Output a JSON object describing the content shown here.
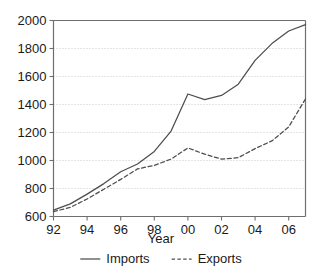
{
  "chart_data": {
    "type": "line",
    "title": "",
    "subtitle": "",
    "xlabel": "Year",
    "ylabel": "",
    "xlim": [
      1992,
      2007
    ],
    "ylim": [
      600,
      2000
    ],
    "grid": true,
    "grid_axis": "y",
    "legend_position": "bottom",
    "x": [
      1992,
      1993,
      1994,
      1995,
      1996,
      1997,
      1998,
      1999,
      2000,
      2001,
      2002,
      2003,
      2004,
      2005,
      2006,
      2007
    ],
    "x_tick_values": [
      1992,
      1994,
      1996,
      1998,
      2000,
      2002,
      2004,
      2006
    ],
    "x_tick_labels": [
      "92",
      "94",
      "96",
      "98",
      "00",
      "02",
      "04",
      "06"
    ],
    "y_tick_values": [
      600,
      800,
      1000,
      1200,
      1400,
      1600,
      1800,
      2000
    ],
    "y_tick_labels": [
      "600",
      "800",
      "1000",
      "1200",
      "1400",
      "1600",
      "1800",
      "2000"
    ],
    "series": [
      {
        "name": "Imports",
        "style": "solid",
        "color": "#4d4d4d",
        "values": [
          645,
          690,
          760,
          835,
          920,
          975,
          1065,
          1210,
          1475,
          1435,
          1465,
          1545,
          1715,
          1835,
          1925,
          1970
        ]
      },
      {
        "name": "Exports",
        "style": "dashed",
        "color": "#4d4d4d",
        "values": [
          635,
          665,
          725,
          795,
          865,
          940,
          965,
          1010,
          1090,
          1045,
          1010,
          1020,
          1085,
          1140,
          1240,
          1440
        ]
      }
    ]
  },
  "axis": {
    "x_title": "Year"
  },
  "legend": {
    "items": [
      {
        "label": "Imports",
        "style": "solid"
      },
      {
        "label": "Exports",
        "style": "dashed"
      }
    ]
  },
  "colors": {
    "line": "#4d4d4d",
    "axis": "#6e6e6e",
    "grid": "#c9c9c9",
    "text": "#1a1a1a",
    "background": "#ffffff"
  }
}
